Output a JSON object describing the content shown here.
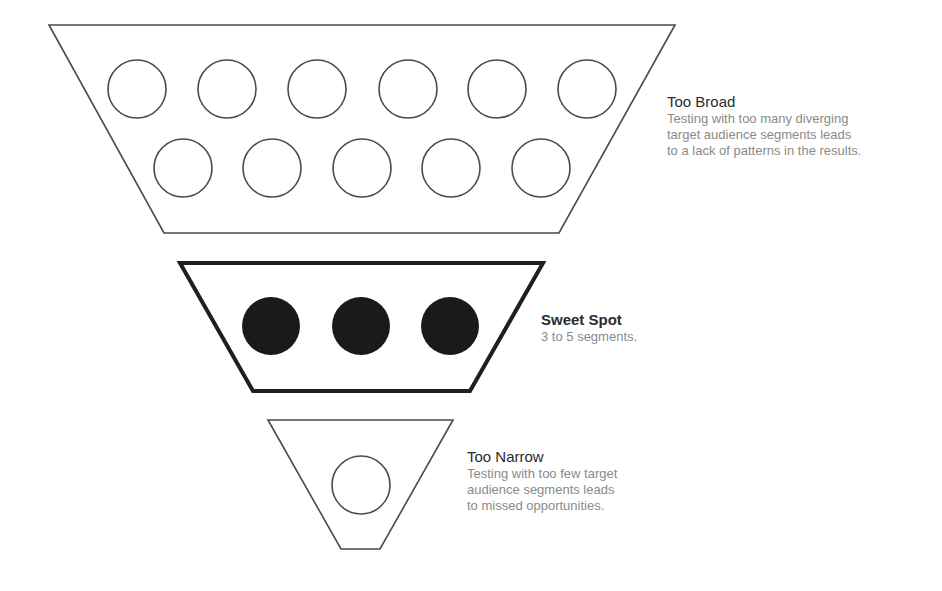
{
  "tiers": [
    {
      "id": "too-broad",
      "title": "Too Broad",
      "title_bold": false,
      "description_lines": [
        "Testing with too many diverging",
        "target audience segments leads",
        "to a lack of patterns in the results."
      ],
      "segments": 11,
      "segment_style": "outline"
    },
    {
      "id": "sweet-spot",
      "title": "Sweet Spot",
      "title_bold": true,
      "description_lines": [
        "3 to 5 segments."
      ],
      "segments": 3,
      "segment_style": "filled"
    },
    {
      "id": "too-narrow",
      "title": "Too Narrow",
      "title_bold": false,
      "description_lines": [
        "Testing with too few target",
        "audience segments leads",
        "to missed opportunities."
      ],
      "segments": 1,
      "segment_style": "outline"
    }
  ],
  "colors": {
    "stroke": "#4a4a4a",
    "fill": "#1a1a1a",
    "title": "#2b2b2b",
    "description": "#8a8a8a"
  }
}
